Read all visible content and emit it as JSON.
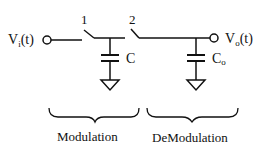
{
  "diagram": {
    "input_label": {
      "main": "V",
      "sub": "i",
      "suffix": "(t)"
    },
    "output_label": {
      "main": "V",
      "sub": "o",
      "suffix": "(t)"
    },
    "switch_1_label": "1",
    "switch_2_label": "2",
    "capacitor_1_label": "C",
    "capacitor_2_label": {
      "main": "C",
      "sub": "o"
    },
    "section_labels": [
      "Modulation",
      "DeModulation"
    ],
    "stroke_color": "#111111",
    "background": "#ffffff"
  }
}
